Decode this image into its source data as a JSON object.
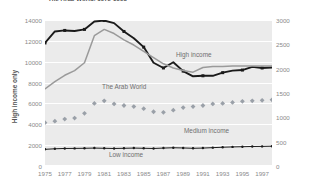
{
  "title": "The Arab World, 1975-1998",
  "axes": {
    "y_left_label": "High income only",
    "y_left_ticks": [
      "0",
      "2000",
      "4000",
      "6000",
      "8000",
      "10000",
      "12000",
      "14000"
    ],
    "y_right_ticks": [
      "0",
      "500",
      "1000",
      "1500",
      "2000",
      "2500",
      "3000"
    ],
    "x_ticks": [
      "1975",
      "1977",
      "1979",
      "1981",
      "1983",
      "1985",
      "1987",
      "1989",
      "1991",
      "1993",
      "1995",
      "1997"
    ]
  },
  "series_labels": {
    "high_income": "High income",
    "arab_world": "The Arab World",
    "medium_income": "Medium income",
    "low_income": "Low income"
  },
  "colors": {
    "plot_background": "#ebebeb",
    "gridline": "#ffffff",
    "high_income": "#1a1a1a",
    "arab_world": "#9a9a9a",
    "medium_income": "#9aa0a8",
    "low_income": "#1a1a1a",
    "tick_text": "#8a8a8a",
    "label_text": "#6f6f6f"
  },
  "chart_data": {
    "type": "line",
    "title": "The Arab World, 1975-1998",
    "xlabel": "",
    "ylabel": "High income only",
    "ylim": [
      0,
      14000
    ],
    "y2lim": [
      0,
      3000
    ],
    "grid": true,
    "legend": "in-plot-labels",
    "x": [
      1975,
      1976,
      1977,
      1978,
      1979,
      1980,
      1981,
      1982,
      1983,
      1984,
      1985,
      1986,
      1987,
      1988,
      1989,
      1990,
      1991,
      1992,
      1993,
      1994,
      1995,
      1996,
      1997,
      1998
    ],
    "series": [
      {
        "name": "High income",
        "axis": "left",
        "style": "line-with-square-markers",
        "color": "#1a1a1a",
        "values": [
          11800,
          12900,
          13000,
          12950,
          13100,
          13850,
          13950,
          13700,
          12900,
          12250,
          11400,
          9900,
          9400,
          9950,
          9100,
          8600,
          8650,
          8650,
          8950,
          9150,
          9200,
          9500,
          9400,
          9450
        ]
      },
      {
        "name": "The Arab World",
        "axis": "left",
        "style": "line",
        "color": "#9a9a9a",
        "values": [
          7400,
          8100,
          8700,
          9150,
          9900,
          12500,
          13100,
          12700,
          12100,
          11600,
          11000,
          10400,
          9800,
          9400,
          9150,
          9000,
          9450,
          9550,
          9550,
          9600,
          9600,
          9600,
          9600,
          9600
        ]
      },
      {
        "name": "Medium income",
        "axis": "left",
        "style": "diamond-markers",
        "color": "#9aa0a8",
        "values": [
          4150,
          4300,
          4500,
          4600,
          5050,
          6000,
          6250,
          5950,
          5800,
          5700,
          5500,
          5200,
          5150,
          5350,
          5600,
          5700,
          5800,
          5950,
          6000,
          6100,
          6200,
          6250,
          6300,
          6350
        ]
      },
      {
        "name": "Low income",
        "axis": "left",
        "style": "thin-line-with-dot-markers",
        "color": "#1a1a1a",
        "values": [
          1600,
          1650,
          1680,
          1690,
          1700,
          1720,
          1700,
          1680,
          1700,
          1720,
          1700,
          1680,
          1720,
          1750,
          1730,
          1700,
          1720,
          1760,
          1800,
          1830,
          1850,
          1870,
          1880,
          1900
        ]
      }
    ]
  }
}
